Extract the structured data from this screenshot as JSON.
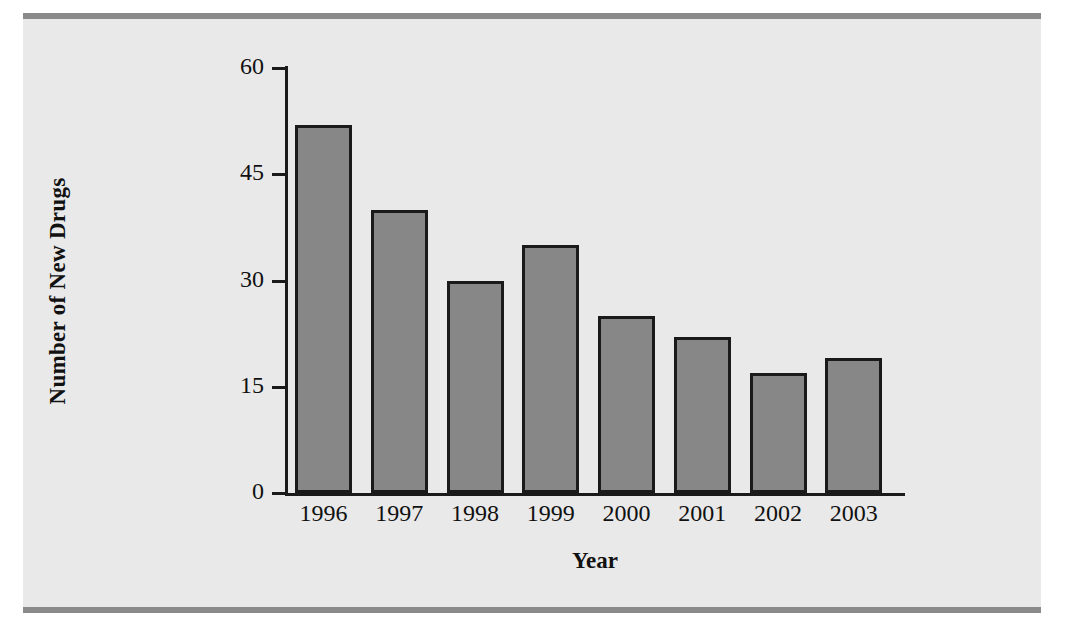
{
  "figure": {
    "background_color": "#e9e9e9",
    "rule_color": "#8a8a8a"
  },
  "chart_data": {
    "type": "bar",
    "title": "",
    "subtitle": "",
    "xlabel": "Year",
    "ylabel": "Number of New Drugs",
    "categories": [
      "1996",
      "1997",
      "1998",
      "1999",
      "2000",
      "2001",
      "2002",
      "2003"
    ],
    "values": [
      52,
      40,
      30,
      35,
      25,
      22,
      17,
      19
    ],
    "series": [
      {
        "name": "Number of New Drugs",
        "values": [
          52,
          40,
          30,
          35,
          25,
          22,
          17,
          19
        ]
      }
    ],
    "ylim": [
      0,
      60
    ],
    "ytick_labels": [
      "0",
      "15",
      "30",
      "45",
      "60"
    ],
    "ytick_values": [
      0,
      15,
      30,
      45,
      60
    ],
    "xtick_labels": [
      "1996",
      "1997",
      "1998",
      "1999",
      "2000",
      "2001",
      "2002",
      "2003"
    ],
    "grid": false,
    "legend": false,
    "legend_position": "none",
    "bar_fill_color": "#878787",
    "bar_edge_color": "#1a1a1a",
    "axis_color": "#1a1a1a",
    "annotations": []
  }
}
